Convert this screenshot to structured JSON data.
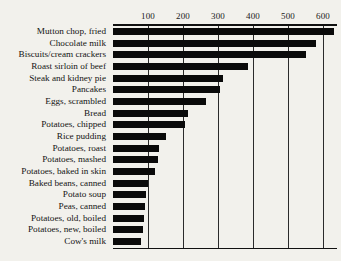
{
  "chart_data": {
    "type": "bar",
    "orientation": "horizontal",
    "title": "",
    "subtitle": "",
    "xlabel": "",
    "ylabel": "",
    "xlim": [
      0,
      640
    ],
    "grid": true,
    "grid_axis": "x",
    "legend": false,
    "bar_color": "#0a0a0a",
    "background_color": "#f2f1ec",
    "xticks": [
      100,
      200,
      300,
      400,
      500,
      600
    ],
    "xtick_labels": [
      "100",
      "200",
      "300",
      "400",
      "500",
      "600"
    ],
    "categories": [
      "Mutton chop, fried",
      "Chocolate milk",
      "Biscuits/cream crackers",
      "Roast sirloin of beef",
      "Steak and kidney pie",
      "Pancakes",
      "Eggs, scrambled",
      "Bread",
      "Potatoes, chipped",
      "Rice pudding",
      "Potatoes, roast",
      "Potatoes, mashed",
      "Potatoes, baked in skin",
      "Baked beans, canned",
      "Potato soup",
      "Peas, canned",
      "Potatoes, old, boiled",
      "Potatoes, new, boiled",
      "Cow's milk"
    ],
    "values": [
      630,
      580,
      550,
      385,
      315,
      305,
      265,
      215,
      205,
      150,
      130,
      128,
      120,
      100,
      95,
      90,
      88,
      85,
      80
    ]
  }
}
